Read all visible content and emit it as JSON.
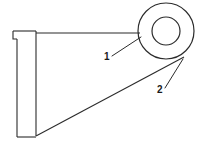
{
  "figure": {
    "background_color": "#ffffff",
    "line_color": "#2b2b2b",
    "width": 206,
    "height": 148
  },
  "callouts": [
    {
      "id": "callout-1",
      "label": "1",
      "label_x": 104,
      "label_y": 60,
      "leader_from_x": 112,
      "leader_from_y": 56,
      "leader_to_x": 140,
      "leader_to_y": 37,
      "points_to": "boss-outer-ring"
    },
    {
      "id": "callout-2",
      "label": "2",
      "label_x": 157,
      "label_y": 93,
      "leader_from_x": 165,
      "leader_from_y": 88,
      "leader_to_x": 183,
      "leader_to_y": 60,
      "points_to": "tangent-edge"
    }
  ],
  "geometry": {
    "body_path": "M 13,31 L 36,31 L 36,33 L 140,33 M 13,31 L 13,39 L 17,39 L 17,137 L 36,137 L 36,33 M 17,39 L 17,39",
    "flange_step_path": "M 13,31 L 13,39 L 17,39",
    "top_edge_path": "M 13,31 L 36,31",
    "spine_left_path": "M 17,39 L 17,137",
    "spine_right_path": "M 36,31 L 36,137",
    "bottom_edge_path": "M 17,137 L 36,137",
    "top_horizontal_path": "M 36,33 L 140,33",
    "tangent_path": "M 36,136 L 183,58",
    "boss": {
      "center_x": 166,
      "center_y": 31,
      "outer_radius": 28,
      "inner_radius": 14
    }
  }
}
